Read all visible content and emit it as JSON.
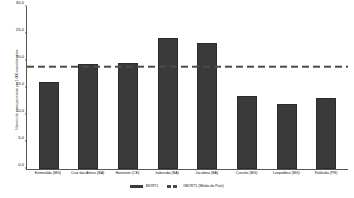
{
  "chart_data": {
    "type": "bar",
    "title": "",
    "xlabel": "",
    "ylabel": "Número de crianças mortas por 1.000 nascidos vivos",
    "ylim": [
      0.0,
      30.0
    ],
    "ytick_labels": [
      "30,0",
      "25,0",
      "20,0",
      "15,0",
      "10,0",
      "5,0",
      "0,0"
    ],
    "ytick_values": [
      30.0,
      25.0,
      20.0,
      15.0,
      10.0,
      5.0,
      0.0
    ],
    "grid": false,
    "legend_position": "bottom",
    "categories": [
      "Esmeralda (MG)",
      "Cruz das Almas (BA)",
      "Horizonte (CE)",
      "Itaberaba (BA)",
      "Jacobina (BA)",
      "Curvelo (MG)",
      "Leopoldina (MG)",
      "Rolândia (PR)"
    ],
    "series": [
      {
        "name": "MORT1",
        "type": "bar",
        "color": "#3a3a3a",
        "values": [
          16.2,
          19.5,
          19.7,
          24.3,
          23.4,
          13.6,
          12.0,
          13.2
        ]
      },
      {
        "name": "#MORT1 (Média do País)",
        "type": "line",
        "style": "dashed",
        "color": "#4a4a4a",
        "value": 18.5
      }
    ]
  },
  "legend": {
    "items": [
      {
        "label": "MORT1"
      },
      {
        "label": "#MORT1 (Média do País)"
      }
    ]
  }
}
